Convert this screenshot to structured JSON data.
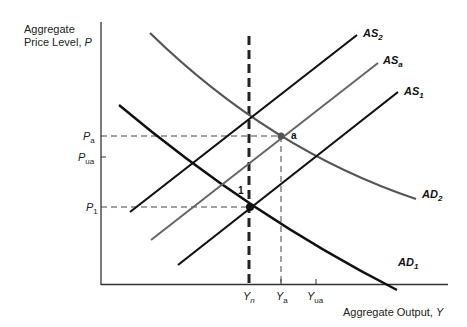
{
  "diagram": {
    "type": "AS-AD macroeconomic model",
    "axes": {
      "y_title_line1": "Aggregate",
      "y_title_line2": "Price Level, ",
      "y_title_var": "P",
      "x_title": "Aggregate Output, ",
      "x_title_var": "Y"
    },
    "y_ticks": [
      {
        "base": "P",
        "sub": "a",
        "y": 136
      },
      {
        "base": "P",
        "sub": "ua",
        "y": 157
      },
      {
        "base": "P",
        "sub": "1",
        "y": 207
      }
    ],
    "x_ticks": [
      {
        "base": "Y",
        "sub": "n",
        "x": 249
      },
      {
        "base": "Y",
        "sub": "a",
        "x": 281
      },
      {
        "base": "Y",
        "sub": "ua",
        "x": 316
      }
    ],
    "curves": [
      {
        "id": "AS2",
        "base": "AS",
        "sub": "2",
        "color": "#111111"
      },
      {
        "id": "ASa",
        "base": "AS",
        "sub": "a",
        "color": "#666666"
      },
      {
        "id": "AS1",
        "base": "AS",
        "sub": "1",
        "color": "#111111"
      },
      {
        "id": "AD2",
        "base": "AD",
        "sub": "2",
        "color": "#555555"
      },
      {
        "id": "AD1",
        "base": "AD",
        "sub": "1",
        "color": "#111111"
      }
    ],
    "points": [
      {
        "label": "a"
      },
      {
        "label": "1"
      }
    ],
    "vertical_line": {
      "label": "long-run natural output Yn",
      "style": "thick dashed"
    }
  }
}
